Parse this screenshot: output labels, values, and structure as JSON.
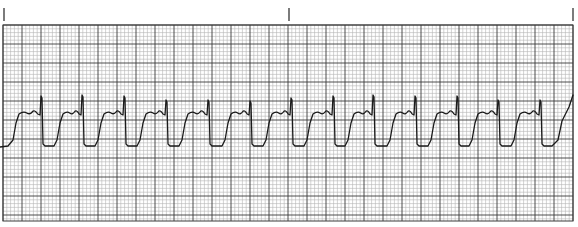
{
  "strip": {
    "type": "ecg-rhythm-strip",
    "lead_label": "",
    "paper_color": "#ffffff",
    "minor_grid_color": "#b5b5b5",
    "major_grid_color": "#3a3a3a",
    "trace_color": "#1a1a1a",
    "marker_color": "#444444",
    "grid": {
      "left": 3,
      "top": 25,
      "right": 573,
      "bottom": 221,
      "major": 19,
      "minor": 3.8
    },
    "time_markers_x": [
      4,
      289,
      573
    ],
    "marker_y": [
      8,
      21
    ],
    "beats": [
      {
        "rise_x": 13,
        "spike_x": 41,
        "spike_y": 96
      },
      {
        "rise_x": 57,
        "spike_x": 82,
        "spike_y": 95
      },
      {
        "rise_x": 98,
        "spike_x": 124,
        "spike_y": 96
      },
      {
        "rise_x": 140,
        "spike_x": 166,
        "spike_y": 100
      },
      {
        "rise_x": 182,
        "spike_x": 208,
        "spike_y": 100
      },
      {
        "rise_x": 225,
        "spike_x": 250,
        "spike_y": 101
      },
      {
        "rise_x": 266,
        "spike_x": 291,
        "spike_y": 98
      },
      {
        "rise_x": 307,
        "spike_x": 333,
        "spike_y": 96
      },
      {
        "rise_x": 348,
        "spike_x": 373,
        "spike_y": 95
      },
      {
        "rise_x": 390,
        "spike_x": 415,
        "spike_y": 96
      },
      {
        "rise_x": 431,
        "spike_x": 457,
        "spike_y": 96
      },
      {
        "rise_x": 472,
        "spike_x": 498,
        "spike_y": 100
      },
      {
        "rise_x": 514,
        "spike_x": 540,
        "spike_y": 100
      }
    ],
    "levels": {
      "baseline_y": 146,
      "plateau_y": 113,
      "start_y": 147,
      "end_x": 573,
      "end_y": 95
    }
  }
}
